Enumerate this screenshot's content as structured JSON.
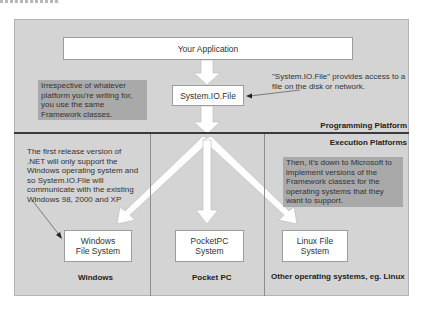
{
  "diagram": {
    "boxes": {
      "your_application": "Your Application",
      "system_io_file": "System.IO.File",
      "windows_fs": "Windows File System",
      "pocketpc_fs": "PocketPC System",
      "linux_fs": "Linux File System"
    },
    "notes": {
      "framework_classes": "Irrespective of whatever platform you're writing for, you use the same Framework classes.",
      "system_io_access": "\"System.IO.File\" provides access to a file on the disk or network.",
      "first_release": "The first release version of .NET will only support the Windows operating system and so System.IO.File will communicate with the existing Windows 98, 2000 and XP",
      "microsoft_implement": "Then, it's down to Microsoft to implement versions of the Framework classes for the operating systems that they want to support."
    },
    "section_labels": {
      "programming_platform": "Programming Platform",
      "execution_platforms": "Execution Platforms"
    },
    "column_labels": {
      "windows": "Windows",
      "pocketpc": "Pocket PC",
      "other": "Other operating systems, eg. Linux"
    },
    "colors": {
      "frame_bg": "#d4d4d4",
      "shaded_note_bg": "#a9a9a9",
      "box_bg": "#ffffff",
      "divider": "#3a3a3a"
    }
  }
}
